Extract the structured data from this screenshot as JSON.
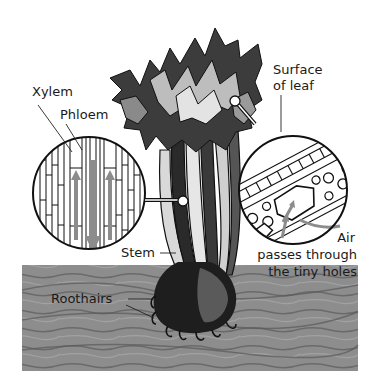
{
  "diagram": {
    "labels": {
      "xylem": "Xylem",
      "phloem": "Phloem",
      "surface_line1": "Surface",
      "surface_line2": "of leaf",
      "air_line1": "Air",
      "air_line2": "passes through",
      "air_line3": "the tiny holes",
      "stem": "Stem",
      "roothairs": "Roothairs"
    },
    "insets": [
      {
        "name": "stem-cross-section",
        "shows": [
          "Xylem",
          "Phloem"
        ]
      },
      {
        "name": "leaf-surface-magnified",
        "shows": [
          "Surface of leaf",
          "Air passes through the tiny holes"
        ]
      }
    ],
    "colors": {
      "ink": "#111111",
      "soil": "#8a8a8a",
      "soil_dark": "#5e5e5e",
      "arrow_gray": "#8c8c8c",
      "background": "#ffffff"
    }
  }
}
